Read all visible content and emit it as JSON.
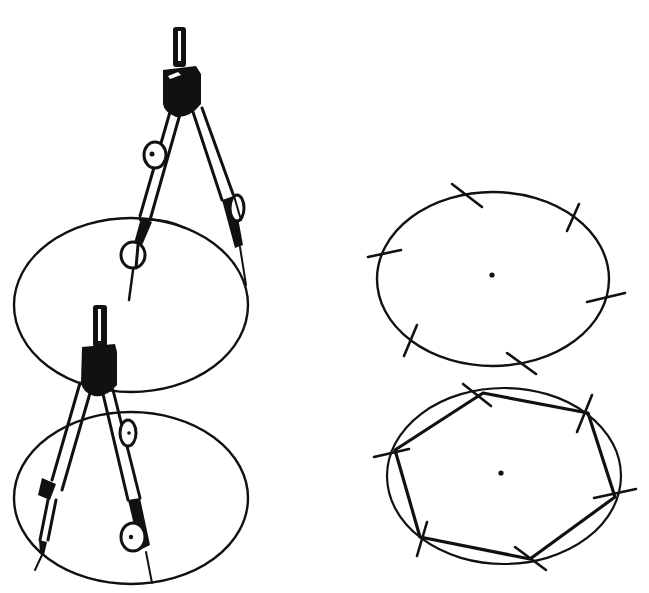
{
  "figure": {
    "panels": [
      {
        "id": "step-1",
        "label": "",
        "content": "Compass drawing a circle"
      },
      {
        "id": "step-2",
        "label": "",
        "content": "Compass stepping off radius around circle"
      },
      {
        "id": "step-3",
        "label": "",
        "content": "Circle with six arc marks and center point"
      },
      {
        "id": "step-4",
        "label": "",
        "content": "Hexagon drawn by joining the six arc marks"
      }
    ],
    "colors": {
      "ink": "#111111",
      "background": "#ffffff"
    }
  }
}
